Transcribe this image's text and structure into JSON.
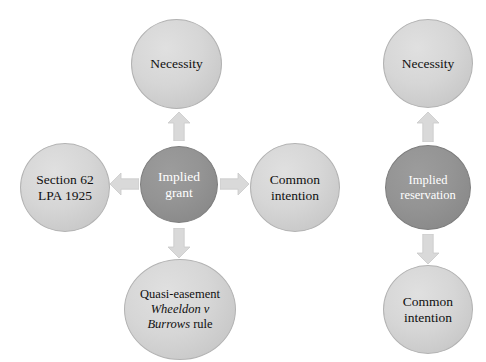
{
  "diagram": {
    "colors": {
      "node_light_fill": "#d4d4d4",
      "node_light_stroke": "#b2b2b2",
      "node_dark_fill": "#8f8f8f",
      "node_dark_stroke": "#7d7d7d",
      "arrow_fill": "#d9d9d9",
      "arrow_stroke": "#c6c6c6",
      "text_dark": "#101010",
      "text_light": "#ffffff",
      "background": "#ffffff"
    },
    "groups": [
      {
        "id": "implied-grant",
        "center": {
          "name": "implied-grant",
          "line1": "Implied",
          "line2": "grant",
          "style": "dark"
        },
        "nodes": [
          {
            "name": "necessity-grant",
            "line1": "Necessity",
            "line2": "",
            "line3": "",
            "style": "light"
          },
          {
            "name": "section-62-lpa-1925",
            "line1": "Section 62",
            "line2": "LPA 1925",
            "line3": "",
            "style": "light"
          },
          {
            "name": "common-intention-grant",
            "line1": "Common",
            "line2": "intention",
            "line3": "",
            "style": "light"
          },
          {
            "name": "quasi-easement-wheeldon-v-burrows",
            "line1": "Quasi-easement",
            "line2_italic": "Wheeldon v",
            "line3_italic": "Burrows",
            "line3_roman": " rule",
            "style": "light"
          }
        ],
        "arrows": [
          {
            "name": "arrow-grant-to-necessity",
            "direction": "up"
          },
          {
            "name": "arrow-grant-to-section-62",
            "direction": "left"
          },
          {
            "name": "arrow-grant-to-common-intention",
            "direction": "right"
          },
          {
            "name": "arrow-grant-to-quasi-easement",
            "direction": "down"
          }
        ]
      },
      {
        "id": "implied-reservation",
        "center": {
          "name": "implied-reservation",
          "line1": "Implied",
          "line2": "reservation",
          "style": "dark"
        },
        "nodes": [
          {
            "name": "necessity-reservation",
            "line1": "Necessity",
            "line2": "",
            "style": "light"
          },
          {
            "name": "common-intention-reservation",
            "line1": "Common",
            "line2": "intention",
            "style": "light"
          }
        ],
        "arrows": [
          {
            "name": "arrow-reservation-to-necessity",
            "direction": "up"
          },
          {
            "name": "arrow-reservation-to-common-intention",
            "direction": "down"
          }
        ]
      }
    ]
  }
}
